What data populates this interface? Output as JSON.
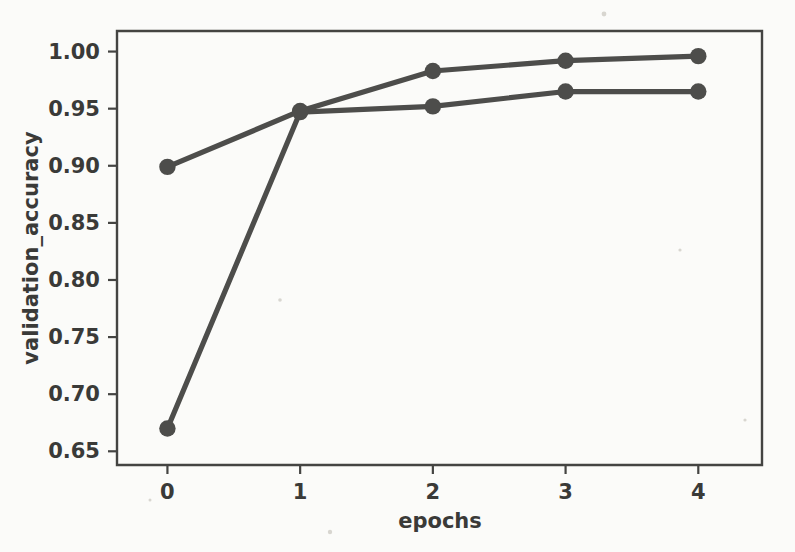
{
  "figure": {
    "background_color": "#fbfbf9",
    "axes_color": "#444442",
    "text_color": "#3a3a38"
  },
  "chart_data": {
    "type": "line",
    "title": "",
    "subtitle": "",
    "xlabel": "epochs",
    "ylabel": "validation_accuracy",
    "x": [
      0,
      1,
      2,
      3,
      4
    ],
    "xticklabels": [
      "0",
      "1",
      "2",
      "3",
      "4"
    ],
    "yticks": [
      0.65,
      0.7,
      0.75,
      0.8,
      0.85,
      0.9,
      0.95,
      1.0
    ],
    "yticklabels": [
      "0.65",
      "0.70",
      "0.75",
      "0.80",
      "0.85",
      "0.90",
      "0.95",
      "1.00"
    ],
    "xlim": [
      -0.38,
      4.48
    ],
    "ylim": [
      0.638,
      1.018
    ],
    "grid": false,
    "legend": null,
    "legend_position": "none",
    "series": [
      {
        "name": "series-1",
        "color": "#4d4d4b",
        "marker": "circle",
        "values": [
          0.899,
          0.948,
          0.983,
          0.992,
          0.996
        ]
      },
      {
        "name": "series-2",
        "color": "#4d4d4b",
        "marker": "circle",
        "values": [
          0.67,
          0.947,
          0.952,
          0.965,
          0.965
        ]
      }
    ]
  }
}
